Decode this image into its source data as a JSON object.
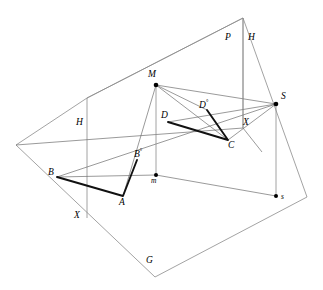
{
  "figure": {
    "type": "geometric-diagram",
    "background_color": "#ffffff",
    "line_color": "#6e6e6e",
    "thick_line_color": "#111111",
    "planes": [
      {
        "name": "G",
        "label": "G",
        "label_position": {
          "x": 146,
          "y": 256
        },
        "outline": "16,145 87,98 243,18 307,197 155,277"
      },
      {
        "name": "P",
        "label": "P",
        "label_position": {
          "x": 225,
          "y": 33
        },
        "outline": "87,98 243,18 243,128"
      },
      {
        "name": "H-left",
        "label": "H",
        "label_position": {
          "x": 76,
          "y": 118
        }
      },
      {
        "name": "H-right",
        "label": "H",
        "label_position": {
          "x": 248,
          "y": 33
        }
      }
    ],
    "points": [
      {
        "id": "M",
        "label": "M",
        "x": 156,
        "y": 85,
        "dot": true,
        "label_x": 148,
        "label_y": 70
      },
      {
        "id": "S",
        "label": "S",
        "x": 276,
        "y": 104,
        "dot": true,
        "label_x": 281,
        "label_y": 92
      },
      {
        "id": "s",
        "label": "s",
        "x": 276,
        "y": 196,
        "dot": true,
        "label_x": 281,
        "label_y": 193
      },
      {
        "id": "m",
        "label": "m",
        "x": 156,
        "y": 175,
        "dot": true,
        "label_x": 151,
        "label_y": 177
      },
      {
        "id": "A",
        "label": "A",
        "x": 123,
        "y": 196,
        "dot": false,
        "label_x": 119,
        "label_y": 198
      },
      {
        "id": "B",
        "label": "B",
        "x": 57,
        "y": 177,
        "dot": false,
        "label_x": 48,
        "label_y": 168
      },
      {
        "id": "C",
        "label": "C",
        "x": 228,
        "y": 140,
        "dot": false,
        "label_x": 228,
        "label_y": 141
      },
      {
        "id": "D",
        "label": "D",
        "x": 168,
        "y": 122,
        "dot": false,
        "label_x": 161,
        "label_y": 111
      },
      {
        "id": "Bo",
        "label": "B",
        "sup": "°",
        "x": 137,
        "y": 160,
        "dot": false,
        "label_x": 134,
        "label_y": 148
      },
      {
        "id": "Do",
        "label": "D",
        "sup": "°",
        "x": 207,
        "y": 110,
        "dot": false,
        "label_x": 199,
        "label_y": 99
      },
      {
        "id": "X-bottom",
        "label": "X",
        "x": 78,
        "y": 215,
        "dot": false,
        "label_x": 74,
        "label_y": 211
      },
      {
        "id": "X-right",
        "label": "X",
        "x": 247,
        "y": 128,
        "dot": false,
        "label_x": 243,
        "label_y": 118
      }
    ],
    "thin_segments": [
      {
        "name": "M-to-S",
        "from": [
          156,
          85
        ],
        "to": [
          276,
          104
        ]
      },
      {
        "name": "M-to-C",
        "from": [
          156,
          85
        ],
        "to": [
          228,
          140
        ]
      },
      {
        "name": "M-to-Dcircle",
        "from": [
          156,
          85
        ],
        "to": [
          228,
          140
        ]
      },
      {
        "name": "M-to-m",
        "from": [
          156,
          85
        ],
        "to": [
          156,
          175
        ]
      },
      {
        "name": "M-to-A",
        "from": [
          156,
          85
        ],
        "to": [
          123,
          196
        ]
      },
      {
        "name": "S-to-D",
        "from": [
          276,
          104
        ],
        "to": [
          168,
          122
        ]
      },
      {
        "name": "S-to-C",
        "from": [
          276,
          104
        ],
        "to": [
          228,
          140
        ]
      },
      {
        "name": "S-to-s",
        "from": [
          276,
          104
        ],
        "to": [
          276,
          196
        ]
      },
      {
        "name": "m-to-s",
        "from": [
          156,
          175
        ],
        "to": [
          276,
          196
        ]
      },
      {
        "name": "m-to-B",
        "from": [
          156,
          175
        ],
        "to": [
          57,
          177
        ]
      },
      {
        "name": "horizon-line",
        "from": [
          16,
          145
        ],
        "to": [
          243,
          128
        ]
      },
      {
        "name": "ground-ridge",
        "from": [
          57,
          177
        ],
        "to": [
          276,
          104
        ]
      }
    ],
    "thick_segments": [
      {
        "name": "B-to-A",
        "from": [
          57,
          177
        ],
        "to": [
          123,
          196
        ]
      },
      {
        "name": "A-to-Bo",
        "from": [
          123,
          196
        ],
        "to": [
          137,
          160
        ]
      },
      {
        "name": "D-to-C",
        "from": [
          168,
          122
        ],
        "to": [
          228,
          140
        ]
      },
      {
        "name": "C-to-Do",
        "from": [
          228,
          140
        ],
        "to": [
          207,
          110
        ]
      }
    ]
  }
}
